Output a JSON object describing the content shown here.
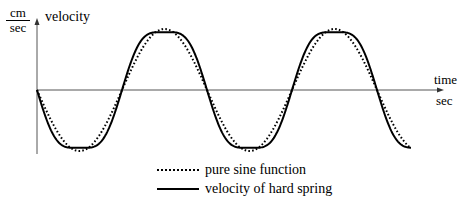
{
  "chart_data": {
    "type": "line",
    "title": "",
    "ylabel": "velocity",
    "yunit_numerator": "cm",
    "yunit_denominator": "sec",
    "xlabel": "time",
    "xunit": "sec",
    "grid": false,
    "legend_position": "bottom-center",
    "axis_ranges": {
      "x": [
        0,
        2.4
      ],
      "y": [
        -1,
        1
      ]
    },
    "series": [
      {
        "name": "pure sine function",
        "style": "dotted",
        "function": "-sin(2*pi*t)",
        "x": [
          0,
          0.25,
          0.5,
          0.75,
          1.0,
          1.25,
          1.5,
          1.75,
          2.0,
          2.2
        ],
        "values": [
          0,
          -1,
          0,
          1,
          0,
          -1,
          0,
          1,
          0,
          -0.95
        ]
      },
      {
        "name": "velocity of hard spring",
        "style": "solid",
        "function": "approx. flattened sine, slightly steeper slopes and broader peaks",
        "x": [
          0,
          0.25,
          0.5,
          0.75,
          1.0,
          1.25,
          1.5,
          1.75,
          2.0,
          2.2
        ],
        "values": [
          0,
          -1,
          0,
          1,
          0,
          -1,
          0,
          1,
          0,
          -0.95
        ]
      }
    ],
    "color": "#000000"
  },
  "axes": {
    "y_label": "velocity",
    "y_unit_num": "cm",
    "y_unit_den": "sec",
    "x_label": "time",
    "x_unit": "sec"
  },
  "legend": {
    "items": [
      {
        "label": "pure sine function",
        "style": "dotted"
      },
      {
        "label": "velocity of hard spring",
        "style": "solid"
      }
    ]
  }
}
